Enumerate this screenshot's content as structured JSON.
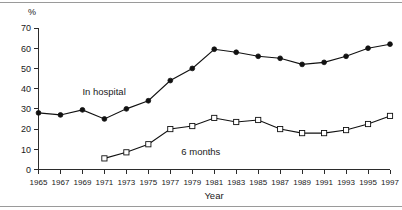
{
  "chart_data": {
    "type": "line",
    "title": "",
    "subtitle": "",
    "xlabel": "Year",
    "ylabel": "%",
    "unit_label": "%",
    "x": [
      1965,
      1967,
      1969,
      1971,
      1973,
      1975,
      1977,
      1979,
      1981,
      1983,
      1985,
      1987,
      1989,
      1991,
      1993,
      1995,
      1997
    ],
    "categories": [
      "1965",
      "1967",
      "1969",
      "1971",
      "1973",
      "1975",
      "1977",
      "1979",
      "1981",
      "1983",
      "1985",
      "1987",
      "1989",
      "1991",
      "1993",
      "1995",
      "1997"
    ],
    "xlim": [
      1965,
      1997
    ],
    "ylim": [
      0,
      70
    ],
    "y_ticks": [
      0,
      10,
      20,
      30,
      40,
      50,
      60,
      70
    ],
    "y_tick_labels": [
      "0",
      "10",
      "20",
      "30",
      "40",
      "50",
      "60",
      "70"
    ],
    "grid": false,
    "legend_position": "inline-annotation",
    "series": [
      {
        "name": "In hospital",
        "marker": "filled-circle",
        "color": "#111111",
        "x": [
          1965,
          1967,
          1969,
          1971,
          1973,
          1975,
          1977,
          1979,
          1981,
          1983,
          1985,
          1987,
          1989,
          1991,
          1993,
          1995,
          1997
        ],
        "values": [
          28,
          27,
          29.5,
          25,
          30,
          34,
          44,
          50,
          59.5,
          58,
          56,
          55,
          52,
          53,
          56,
          60,
          62
        ]
      },
      {
        "name": "6 months",
        "marker": "open-square",
        "color": "#111111",
        "x": [
          1971,
          1973,
          1975,
          1977,
          1979,
          1981,
          1983,
          1985,
          1987,
          1989,
          1991,
          1993,
          1995,
          1997
        ],
        "values": [
          5.5,
          8.5,
          12.5,
          20,
          21.5,
          25.5,
          23.5,
          24.5,
          20,
          18,
          18,
          19.5,
          22.5,
          26.5
        ]
      }
    ],
    "annotations": [
      {
        "text": "In hospital",
        "x": 1969,
        "y": 37,
        "anchor": "start"
      },
      {
        "text": "6 months",
        "x": 1978,
        "y": 7,
        "anchor": "start"
      }
    ]
  },
  "figure": {
    "background_color": "#ffffff",
    "axis_color": "#2b2b2b",
    "line_color": "#111111"
  }
}
